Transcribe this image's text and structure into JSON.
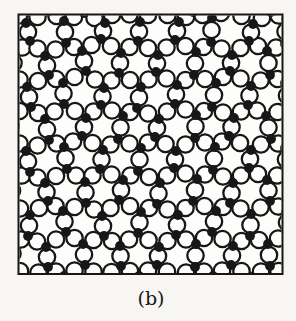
{
  "page": {
    "background": "#f7f6f2",
    "ink_color": "#171717",
    "paper_color": "#fdfdfb"
  },
  "figure": {
    "caption": "(b)",
    "frame": {
      "x": 18.5,
      "y": 14.5,
      "width": 264,
      "height": 259.5,
      "stroke_width": 2
    },
    "network": {
      "circle_radius": 8.2,
      "circle_stroke_width": 2.3,
      "dot_radius": 4.9,
      "cols": 16,
      "vertical_bond_rule": "(i+k)%2==0",
      "rows": [
        [
          [
            12,
            8
          ],
          [
            26,
            23
          ],
          [
            49,
            11
          ],
          [
            64,
            21
          ],
          [
            84,
            13
          ],
          [
            105,
            23
          ],
          [
            119,
            7
          ],
          [
            140,
            22
          ],
          [
            156,
            8
          ],
          [
            179,
            22
          ],
          [
            193,
            12
          ],
          [
            212,
            18
          ],
          [
            230,
            8
          ],
          [
            253,
            24
          ],
          [
            271,
            12
          ],
          [
            286,
            19
          ]
        ],
        [
          [
            15,
            54
          ],
          [
            30,
            41
          ],
          [
            45,
            56
          ],
          [
            66,
            43
          ],
          [
            82,
            51
          ],
          [
            101,
            39
          ],
          [
            121,
            53
          ],
          [
            138,
            41
          ],
          [
            158,
            55
          ],
          [
            175,
            40
          ],
          [
            196,
            52
          ],
          [
            211,
            42
          ],
          [
            232,
            55
          ],
          [
            249,
            41
          ],
          [
            267,
            51
          ],
          [
            285,
            44
          ]
        ],
        [
          [
            12,
            72
          ],
          [
            27,
            87
          ],
          [
            49,
            75
          ],
          [
            63,
            83
          ],
          [
            86,
            71
          ],
          [
            104,
            88
          ],
          [
            119,
            73
          ],
          [
            141,
            87
          ],
          [
            156,
            72
          ],
          [
            177,
            85
          ],
          [
            194,
            75
          ],
          [
            216,
            83
          ],
          [
            230,
            71
          ],
          [
            251,
            86
          ],
          [
            270,
            75
          ],
          [
            285,
            83
          ]
        ],
        [
          [
            8,
            115
          ],
          [
            31,
            107
          ],
          [
            45,
            119
          ],
          [
            64,
            104
          ],
          [
            86,
            118
          ],
          [
            101,
            105
          ],
          [
            123,
            116
          ],
          [
            137,
            108
          ],
          [
            159,
            119
          ],
          [
            175,
            104
          ],
          [
            196,
            115
          ],
          [
            212,
            107
          ],
          [
            234,
            118
          ],
          [
            248,
            105
          ],
          [
            266,
            116
          ],
          [
            289,
            108
          ]
        ],
        [
          [
            13,
            136
          ],
          [
            26,
            151
          ],
          [
            49,
            140
          ],
          [
            64,
            147
          ],
          [
            82,
            136
          ],
          [
            103,
            150
          ],
          [
            118,
            139
          ],
          [
            141,
            148
          ],
          [
            155,
            137
          ],
          [
            176,
            151
          ],
          [
            195,
            138
          ],
          [
            215,
            147
          ],
          [
            229,
            136
          ],
          [
            251,
            150
          ],
          [
            271,
            139
          ],
          [
            285,
            148
          ]
        ],
        [
          [
            14,
            179
          ],
          [
            30,
            172
          ],
          [
            45,
            183
          ],
          [
            67,
            169
          ],
          [
            85,
            182
          ],
          [
            100,
            169
          ],
          [
            123,
            180
          ],
          [
            138,
            171
          ],
          [
            160,
            183
          ],
          [
            174,
            168
          ],
          [
            197,
            179
          ],
          [
            213,
            170
          ],
          [
            233,
            183
          ],
          [
            249,
            168
          ],
          [
            267,
            180
          ],
          [
            287,
            171
          ]
        ],
        [
          [
            10,
            202
          ],
          [
            30,
            215
          ],
          [
            48,
            201
          ],
          [
            63,
            211
          ],
          [
            86,
            203
          ],
          [
            102,
            216
          ],
          [
            119,
            200
          ],
          [
            141,
            212
          ],
          [
            157,
            204
          ],
          [
            178,
            215
          ],
          [
            193,
            201
          ],
          [
            216,
            211
          ],
          [
            230,
            203
          ],
          [
            251,
            214
          ],
          [
            270,
            201
          ],
          [
            286,
            212
          ]
        ],
        [
          [
            14,
            243
          ],
          [
            28,
            236
          ],
          [
            46,
            247
          ],
          [
            66,
            232
          ],
          [
            83,
            244
          ],
          [
            104,
            236
          ],
          [
            120,
            246
          ],
          [
            138,
            233
          ],
          [
            159,
            247
          ],
          [
            176,
            235
          ],
          [
            196,
            244
          ],
          [
            212,
            232
          ],
          [
            233,
            246
          ],
          [
            250,
            236
          ],
          [
            268,
            244
          ],
          [
            288,
            233
          ]
        ],
        [
          [
            11,
            264
          ],
          [
            29,
            278
          ],
          [
            48,
            267
          ],
          [
            64,
            276
          ],
          [
            85,
            265
          ],
          [
            102,
            278
          ],
          [
            121,
            266
          ],
          [
            139,
            276
          ],
          [
            157,
            265
          ],
          [
            177,
            278
          ],
          [
            195,
            267
          ],
          [
            213,
            276
          ],
          [
            231,
            265
          ],
          [
            252,
            277
          ],
          [
            270,
            266
          ],
          [
            287,
            276
          ]
        ]
      ]
    }
  }
}
